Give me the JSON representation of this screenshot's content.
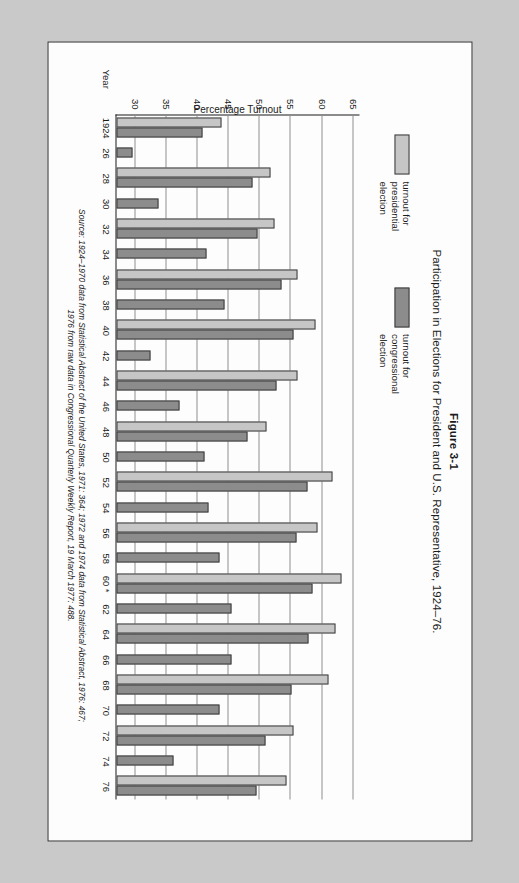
{
  "figure": {
    "label": "Figure 3-1",
    "title": "Participation in Elections for President and U.S. Representative, 1924–76."
  },
  "legend": {
    "position": "top-left",
    "items": [
      {
        "name": "presidential",
        "label": "turnout for\npresidential\nelection",
        "color": "#c6c6c6"
      },
      {
        "name": "congressional",
        "label": "turnout for\ncongressional\nelection",
        "color": "#8c8c8c"
      }
    ]
  },
  "axes": {
    "x_name": "Year",
    "y_label": "Percentage Turnout",
    "y_ticks": [
      30,
      35,
      40,
      45,
      50,
      55,
      60,
      65
    ]
  },
  "source": {
    "line1": "Source: 1924–1970 data from Statistical Abstract of the United States, 1971: 364; 1972 and 1974 data from Statistical Abstract, 1976: 467;",
    "line2": "1976 from raw data in Congressional Quarterly Weekly Report, 19 March 1977: 488."
  },
  "chart_data": {
    "type": "bar",
    "title": "Participation in Elections for President and U.S. Representative, 1924–76.",
    "xlabel": "Year",
    "ylabel": "Percentage Turnout",
    "ylim": [
      27,
      66
    ],
    "grid": true,
    "orientation": "vertical-grouped",
    "categories": [
      "1924",
      "26",
      "28",
      "30",
      "32",
      "34",
      "36",
      "38",
      "40",
      "42",
      "44",
      "46",
      "48",
      "50",
      "52",
      "54",
      "56",
      "58",
      "60 *",
      "62",
      "64",
      "66",
      "68",
      "70",
      "72",
      "74",
      "76"
    ],
    "series": [
      {
        "name": "turnout for presidential election",
        "color": "#c6c6c6",
        "values": [
          43.9,
          null,
          51.7,
          null,
          52.4,
          null,
          56.0,
          null,
          58.9,
          null,
          56.0,
          null,
          51.1,
          null,
          61.6,
          null,
          59.3,
          null,
          63.1,
          null,
          62.2,
          null,
          61.0,
          null,
          55.4,
          null,
          54.3
        ]
      },
      {
        "name": "turnout for congressional election",
        "color": "#8c8c8c",
        "values": [
          40.8,
          29.6,
          48.9,
          33.7,
          49.7,
          41.4,
          53.5,
          44.4,
          55.4,
          32.5,
          52.7,
          37.1,
          48.1,
          41.1,
          57.6,
          41.7,
          55.9,
          43.5,
          58.5,
          45.4,
          57.8,
          45.4,
          55.1,
          43.5,
          50.9,
          36.1,
          49.5
        ]
      }
    ]
  }
}
